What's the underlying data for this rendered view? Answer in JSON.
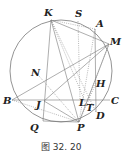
{
  "figure": {
    "caption": "图 32. 20",
    "circle": {
      "cx": 61,
      "cy": 71,
      "r": 51
    },
    "points": {
      "K": {
        "x": 51,
        "y": 20,
        "label": "K",
        "lx": 44,
        "ly": 16
      },
      "S": {
        "x": 78,
        "y": 21,
        "label": "S",
        "lx": 75,
        "ly": 17
      },
      "A": {
        "x": 95,
        "y": 29,
        "label": "A",
        "lx": 96,
        "ly": 27
      },
      "M": {
        "x": 109,
        "y": 44,
        "label": "M",
        "lx": 111,
        "ly": 45
      },
      "N": {
        "x": 39,
        "y": 76,
        "label": "N",
        "lx": 31,
        "ly": 76
      },
      "B": {
        "x": 12,
        "y": 100,
        "label": "B",
        "lx": 3,
        "ly": 104
      },
      "J": {
        "x": 44,
        "y": 101,
        "label": "J",
        "lx": 36,
        "ly": 108
      },
      "L": {
        "x": 80,
        "y": 100,
        "label": "L",
        "lx": 79,
        "ly": 106
      },
      "T": {
        "x": 86,
        "y": 104,
        "label": "T",
        "lx": 86,
        "ly": 111
      },
      "H": {
        "x": 96,
        "y": 83,
        "label": "H",
        "lx": 96,
        "ly": 87
      },
      "C": {
        "x": 110,
        "y": 100,
        "label": "C",
        "lx": 111,
        "ly": 104
      },
      "D": {
        "x": 96,
        "y": 112,
        "label": "D",
        "lx": 96,
        "ly": 119
      },
      "P": {
        "x": 79,
        "y": 122,
        "label": "P",
        "lx": 77,
        "ly": 131
      },
      "Q": {
        "x": 43,
        "y": 121,
        "label": "Q",
        "lx": 30,
        "ly": 131
      }
    }
  }
}
